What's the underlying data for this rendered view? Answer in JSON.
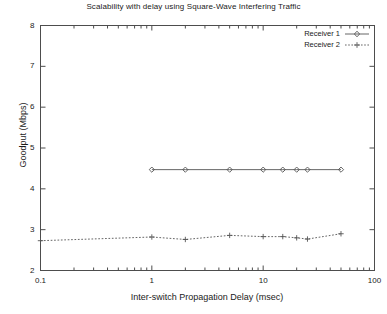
{
  "chart_data": {
    "type": "line",
    "title": "Scalability with delay using Square-Wave Interfering Traffic",
    "xlabel": "Inter-switch Propagation Delay (msec)",
    "ylabel": "Goodput (Mbps)",
    "xscale": "log",
    "yscale": "linear",
    "xlim": [
      0.1,
      100
    ],
    "ylim": [
      2,
      8
    ],
    "grid": false,
    "legend_position": "top-right",
    "xticks": [
      0.1,
      1,
      10,
      100
    ],
    "xtick_labels": [
      "0.1",
      "1",
      "10",
      "100"
    ],
    "yticks": [
      2,
      3,
      4,
      5,
      6,
      7,
      8
    ],
    "ytick_labels": [
      "2",
      "3",
      "4",
      "5",
      "6",
      "7",
      "8"
    ],
    "series": [
      {
        "name": "Receiver 1",
        "color": "#555555",
        "linestyle": "solid",
        "marker": "diamond",
        "x": [
          1.0,
          2.0,
          5.0,
          10.0,
          15.0,
          20.0,
          25.0,
          50.0
        ],
        "y": [
          4.47,
          4.47,
          4.47,
          4.47,
          4.47,
          4.47,
          4.47,
          4.47
        ]
      },
      {
        "name": "Receiver 2",
        "color": "#555555",
        "linestyle": "dashed",
        "marker": "plus",
        "x": [
          0.1,
          1.0,
          2.0,
          5.0,
          10.0,
          15.0,
          20.0,
          25.0,
          50.0
        ],
        "y": [
          2.73,
          2.82,
          2.76,
          2.86,
          2.83,
          2.83,
          2.8,
          2.77,
          2.9
        ]
      }
    ]
  },
  "legend": {
    "entries": [
      {
        "label": "Receiver 1"
      },
      {
        "label": "Receiver 2"
      }
    ]
  }
}
